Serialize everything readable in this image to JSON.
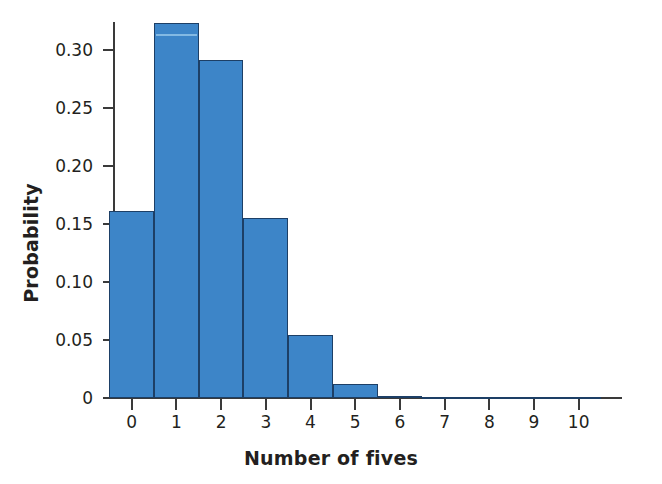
{
  "chart_data": {
    "type": "bar",
    "title": "",
    "subtitle": "",
    "xlabel": "Number of fives",
    "ylabel": "Probability",
    "categories": [
      "0",
      "1",
      "2",
      "3",
      "4",
      "5",
      "6",
      "7",
      "8",
      "9",
      "10"
    ],
    "values": [
      0.161,
      0.323,
      0.291,
      0.155,
      0.054,
      0.012,
      0.002,
      0.0003,
      0.0,
      0.0,
      0.0
    ],
    "xlim": [
      -0.5,
      10.5
    ],
    "ylim": [
      0,
      0.335
    ],
    "yticks": [
      0,
      0.05,
      0.1,
      0.15,
      0.2,
      0.25,
      0.3
    ],
    "ytick_labels": [
      "0",
      "0.05",
      "0.10",
      "0.15",
      "0.20",
      "0.25",
      "0.30"
    ],
    "xticks": [
      0,
      1,
      2,
      3,
      4,
      5,
      6,
      7,
      8,
      9,
      10
    ],
    "xtick_labels": [
      "0",
      "1",
      "2",
      "3",
      "4",
      "5",
      "6",
      "7",
      "8",
      "9",
      "10"
    ],
    "grid": false,
    "legend": null,
    "bar_fill_color": "#3d85c8",
    "bar_edge_color": "#1d3f66",
    "axis_color": "#3a3a3a",
    "text_color": "#231f20",
    "background_color": "#ffffff"
  }
}
